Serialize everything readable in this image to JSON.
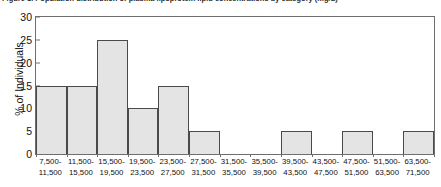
{
  "caption": {
    "text": "Figure 1. Population distribution of plasma lipoprotein lipid concentrations by category (mg/L)",
    "truncated": true
  },
  "chart_data": {
    "type": "bar",
    "title": "",
    "xlabel": "",
    "ylabel": "% of Individuals",
    "ylim": [
      0,
      30
    ],
    "yticks": [
      0,
      5,
      10,
      15,
      20,
      25,
      30
    ],
    "grid": false,
    "legend": null,
    "bar_style": {
      "fill": "#e4e4e4",
      "border": "#4a4a4a",
      "gap": 0
    },
    "categories": [
      "7,500-\n11,500",
      "11,500-\n15,500",
      "15,500-\n19,500",
      "19,500-\n23,500",
      "23,500-\n27,500",
      "27,500-\n31,500",
      "31,500-\n35,500",
      "35,500-\n39,500",
      "39,500-\n43,500",
      "43,500-\n47,500",
      "47,500-\n51,500",
      "51,500-\n63,500",
      "63,500-\n71,500"
    ],
    "bins": [
      {
        "lower": "7,500-",
        "upper": "11,500",
        "value": 15
      },
      {
        "lower": "11,500-",
        "upper": "15,500",
        "value": 15
      },
      {
        "lower": "15,500-",
        "upper": "19,500",
        "value": 25
      },
      {
        "lower": "19,500-",
        "upper": "23,500",
        "value": 10
      },
      {
        "lower": "23,500-",
        "upper": "27,500",
        "value": 15
      },
      {
        "lower": "27,500-",
        "upper": "31,500",
        "value": 5
      },
      {
        "lower": "31,500-",
        "upper": "35,500",
        "value": 0
      },
      {
        "lower": "35,500-",
        "upper": "39,500",
        "value": 0
      },
      {
        "lower": "39,500-",
        "upper": "43,500",
        "value": 5
      },
      {
        "lower": "43,500-",
        "upper": "47,500",
        "value": 0
      },
      {
        "lower": "47,500-",
        "upper": "51,500",
        "value": 5
      },
      {
        "lower": "51,500-",
        "upper": "63,500",
        "value": 0
      },
      {
        "lower": "63,500-",
        "upper": "71,500",
        "value": 5
      }
    ],
    "values": [
      15,
      15,
      25,
      10,
      15,
      5,
      0,
      0,
      5,
      0,
      5,
      0,
      5
    ]
  }
}
